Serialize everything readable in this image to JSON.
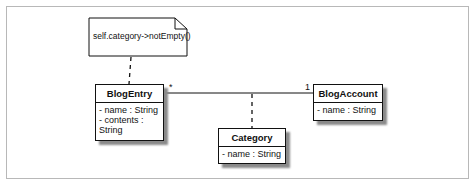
{
  "diagram": {
    "type": "UML class diagram",
    "note": {
      "text": "self.category->notEmpty()"
    },
    "classes": [
      {
        "name": "BlogEntry",
        "attributes": [
          "- name : String",
          "- contents : String"
        ]
      },
      {
        "name": "BlogAccount",
        "attributes": [
          "- name : String"
        ]
      },
      {
        "name": "Category",
        "attributes": [
          "- name : String"
        ]
      }
    ],
    "association": {
      "from": "BlogEntry",
      "to": "BlogAccount",
      "from_multiplicity": "*",
      "to_multiplicity": "1",
      "association_class": "Category"
    }
  }
}
